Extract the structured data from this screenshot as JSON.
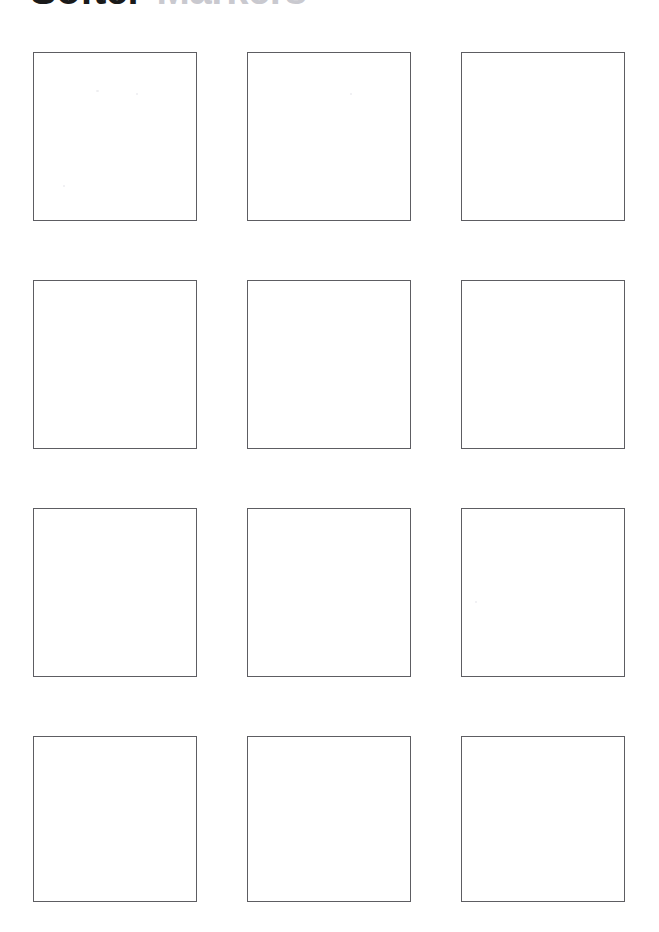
{
  "page": {
    "background_color": "#ffffff",
    "width": 659,
    "height": 932
  },
  "header": {
    "title_primary": "Softer",
    "title_secondary": "Markers",
    "title_primary_color": "#1a1a1a",
    "title_secondary_color": "#c9c9cf",
    "clipped_by_page_top": true
  },
  "grid": {
    "columns": 3,
    "rows": 4,
    "cell_count": 12,
    "cell_border_color": "#5d5d62",
    "cell_fill_color": "#ffffff",
    "cells": [
      {
        "id": "cell-1",
        "row": 1,
        "col": 1,
        "content": ""
      },
      {
        "id": "cell-2",
        "row": 1,
        "col": 2,
        "content": ""
      },
      {
        "id": "cell-3",
        "row": 1,
        "col": 3,
        "content": ""
      },
      {
        "id": "cell-4",
        "row": 2,
        "col": 1,
        "content": ""
      },
      {
        "id": "cell-5",
        "row": 2,
        "col": 2,
        "content": ""
      },
      {
        "id": "cell-6",
        "row": 2,
        "col": 3,
        "content": ""
      },
      {
        "id": "cell-7",
        "row": 3,
        "col": 1,
        "content": ""
      },
      {
        "id": "cell-8",
        "row": 3,
        "col": 2,
        "content": ""
      },
      {
        "id": "cell-9",
        "row": 3,
        "col": 3,
        "content": ""
      },
      {
        "id": "cell-10",
        "row": 4,
        "col": 1,
        "content": ""
      },
      {
        "id": "cell-11",
        "row": 4,
        "col": 2,
        "content": ""
      },
      {
        "id": "cell-12",
        "row": 4,
        "col": 3,
        "content": ""
      }
    ]
  }
}
